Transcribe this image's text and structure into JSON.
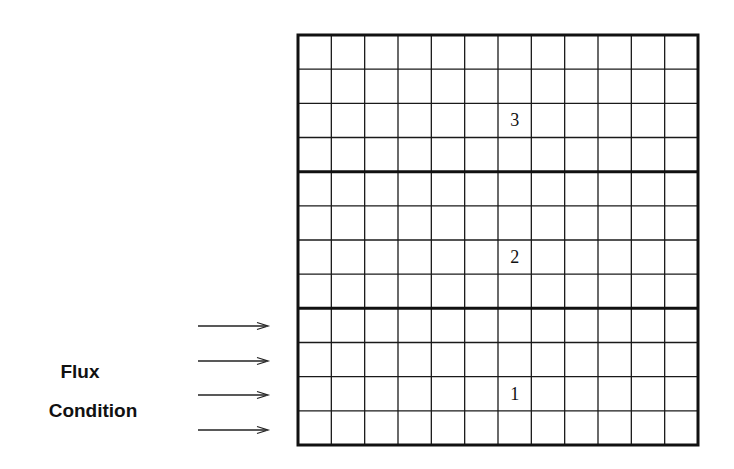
{
  "diagram": {
    "type": "layered grid with boundary flux condition",
    "grid": {
      "columns": 12,
      "rows": 12,
      "left": 298,
      "top": 35,
      "width": 400,
      "height": 410,
      "line_color": "#1a1a1a",
      "thick_divider_rows": [
        4,
        8
      ]
    },
    "regions": [
      {
        "id": "region-3",
        "label": "3",
        "row_index": 2,
        "col_index": 6
      },
      {
        "id": "region-2",
        "label": "2",
        "row_index": 6,
        "col_index": 6
      },
      {
        "id": "region-1",
        "label": "1",
        "row_index": 10,
        "col_index": 6
      }
    ],
    "flux": {
      "label_line1": "Flux",
      "label_line2": "Condition",
      "arrow_count": 4,
      "arrow_ys": [
        326,
        361,
        395,
        430
      ],
      "arrow_x_start": 198,
      "arrow_x_end": 268
    }
  }
}
